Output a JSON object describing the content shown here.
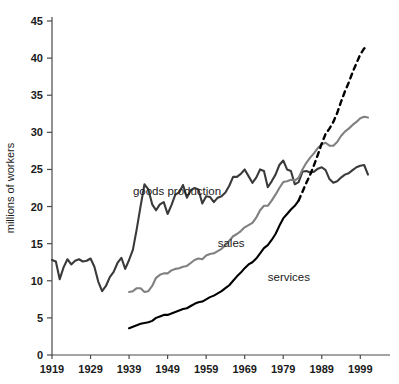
{
  "chart_data": {
    "type": "line",
    "title": "",
    "xlabel": "",
    "ylabel": "millions of workers",
    "xlim": [
      1919,
      2001
    ],
    "ylim": [
      0,
      45
    ],
    "grid": false,
    "legend_position": "inline-labels",
    "x_ticks": [
      "1919",
      "1929",
      "1939",
      "1949",
      "1959",
      "1969",
      "1979",
      "1989",
      "1999"
    ],
    "x_tick_values": [
      1919,
      1929,
      1939,
      1949,
      1959,
      1969,
      1979,
      1989,
      1999
    ],
    "y_ticks": [
      "0",
      "5",
      "10",
      "15",
      "20",
      "25",
      "30",
      "35",
      "40",
      "45"
    ],
    "y_tick_values": [
      0,
      5,
      10,
      15,
      20,
      25,
      30,
      35,
      40,
      45
    ],
    "series": [
      {
        "name": "goods production",
        "label": "goods production",
        "color": "#3a3a3a",
        "style": "solid",
        "label_x": 1940,
        "label_y": 21.5,
        "x": [
          1919,
          1920,
          1921,
          1922,
          1923,
          1924,
          1925,
          1926,
          1927,
          1928,
          1929,
          1930,
          1931,
          1932,
          1933,
          1934,
          1935,
          1936,
          1937,
          1938,
          1939,
          1940,
          1941,
          1942,
          1943,
          1944,
          1945,
          1946,
          1947,
          1948,
          1949,
          1950,
          1951,
          1952,
          1953,
          1954,
          1955,
          1956,
          1957,
          1958,
          1959,
          1960,
          1961,
          1962,
          1963,
          1964,
          1965,
          1966,
          1967,
          1968,
          1969,
          1970,
          1971,
          1972,
          1973,
          1974,
          1975,
          1976,
          1977,
          1978,
          1979,
          1980,
          1981,
          1982,
          1983,
          1984,
          1985,
          1986,
          1987,
          1988,
          1989,
          1990,
          1991,
          1992,
          1993,
          1994,
          1995,
          1996,
          1997,
          1998,
          1999,
          2000,
          2001
        ],
        "y": [
          12.8,
          12.6,
          10.2,
          11.8,
          12.9,
          12.2,
          12.7,
          12.9,
          12.6,
          12.7,
          13.0,
          11.9,
          9.9,
          8.6,
          9.3,
          10.5,
          11.2,
          12.4,
          13.1,
          11.6,
          12.8,
          14.2,
          17.0,
          20.1,
          23.0,
          22.3,
          20.3,
          19.5,
          20.3,
          20.6,
          19.0,
          20.2,
          21.6,
          21.9,
          22.9,
          21.2,
          22.2,
          22.5,
          22.3,
          20.4,
          21.4,
          21.3,
          20.6,
          21.2,
          21.4,
          21.9,
          22.8,
          24.0,
          24.0,
          24.4,
          25.0,
          24.1,
          23.2,
          23.9,
          25.0,
          24.8,
          22.6,
          23.4,
          24.3,
          25.6,
          26.2,
          25.0,
          24.8,
          23.0,
          23.3,
          24.7,
          24.8,
          24.6,
          24.7,
          25.1,
          25.3,
          24.9,
          23.7,
          23.2,
          23.4,
          23.9,
          24.3,
          24.5,
          24.9,
          25.3,
          25.5,
          25.6,
          24.3
        ]
      },
      {
        "name": "sales",
        "label": "sales",
        "color": "#808080",
        "style": "solid",
        "label_x": 1962,
        "label_y": 14.5,
        "x": [
          1939,
          1940,
          1941,
          1942,
          1943,
          1944,
          1945,
          1946,
          1947,
          1948,
          1949,
          1950,
          1951,
          1952,
          1953,
          1954,
          1955,
          1956,
          1957,
          1958,
          1959,
          1960,
          1961,
          1962,
          1963,
          1964,
          1965,
          1966,
          1967,
          1968,
          1969,
          1970,
          1971,
          1972,
          1973,
          1974,
          1975,
          1976,
          1977,
          1978,
          1979,
          1980,
          1981,
          1982,
          1983,
          1984,
          1985,
          1986,
          1987,
          1988,
          1989,
          1990,
          1991,
          1992,
          1993,
          1994,
          1995,
          1996,
          1997,
          1998,
          1999,
          2000,
          2001
        ],
        "y": [
          8.5,
          8.6,
          9.0,
          9.0,
          8.5,
          8.6,
          9.3,
          10.4,
          10.8,
          11.0,
          11.0,
          11.4,
          11.6,
          11.7,
          11.9,
          12.0,
          12.4,
          12.8,
          13.0,
          12.9,
          13.4,
          13.6,
          13.7,
          14.0,
          14.3,
          14.8,
          15.4,
          16.0,
          16.3,
          16.7,
          17.2,
          17.5,
          17.8,
          18.5,
          19.5,
          20.1,
          20.1,
          20.8,
          21.6,
          22.5,
          23.3,
          23.4,
          23.6,
          23.5,
          23.9,
          25.0,
          25.9,
          26.6,
          27.2,
          27.9,
          28.4,
          28.6,
          28.2,
          28.2,
          28.7,
          29.5,
          30.1,
          30.5,
          31.0,
          31.4,
          31.9,
          32.1,
          32.0
        ]
      },
      {
        "name": "services",
        "label": "services",
        "color": "#000000",
        "style": "solid-then-dashed",
        "dash_start_year": 1983,
        "label_x": 1975,
        "label_y": 10.0,
        "x": [
          1939,
          1940,
          1941,
          1942,
          1943,
          1944,
          1945,
          1946,
          1947,
          1948,
          1949,
          1950,
          1951,
          1952,
          1953,
          1954,
          1955,
          1956,
          1957,
          1958,
          1959,
          1960,
          1961,
          1962,
          1963,
          1964,
          1965,
          1966,
          1967,
          1968,
          1969,
          1970,
          1971,
          1972,
          1973,
          1974,
          1975,
          1976,
          1977,
          1978,
          1979,
          1980,
          1981,
          1982,
          1983,
          1984,
          1985,
          1986,
          1987,
          1988,
          1989,
          1990,
          1991,
          1992,
          1993,
          1994,
          1995,
          1996,
          1997,
          1998,
          1999,
          2000,
          2001
        ],
        "y": [
          3.6,
          3.8,
          4.0,
          4.2,
          4.3,
          4.4,
          4.6,
          5.0,
          5.2,
          5.4,
          5.4,
          5.6,
          5.8,
          6.0,
          6.2,
          6.3,
          6.6,
          6.9,
          7.1,
          7.2,
          7.5,
          7.8,
          8.0,
          8.3,
          8.6,
          9.0,
          9.4,
          10.0,
          10.6,
          11.1,
          11.7,
          12.2,
          12.5,
          13.0,
          13.7,
          14.4,
          14.8,
          15.5,
          16.3,
          17.4,
          18.4,
          19.0,
          19.6,
          20.1,
          20.8,
          22.0,
          23.2,
          24.3,
          25.6,
          27.0,
          28.5,
          29.8,
          30.5,
          31.4,
          32.6,
          34.1,
          35.5,
          36.7,
          38.1,
          39.3,
          40.5,
          41.3,
          41.6
        ]
      }
    ]
  }
}
